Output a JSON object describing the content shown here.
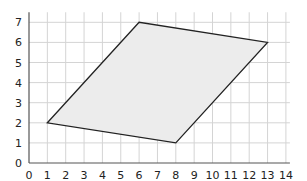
{
  "chart_data": {
    "type": "polygon",
    "title": "",
    "xlabel": "",
    "ylabel": "",
    "xlim": [
      0,
      14
    ],
    "ylim": [
      0,
      7.5
    ],
    "grid": true,
    "x_ticks": [
      0,
      1,
      2,
      3,
      4,
      5,
      6,
      7,
      8,
      9,
      10,
      11,
      12,
      13,
      14
    ],
    "y_ticks": [
      0,
      1,
      2,
      3,
      4,
      5,
      6,
      7
    ],
    "polygon": {
      "name": "parallelogram",
      "vertices": [
        [
          1,
          2
        ],
        [
          6,
          7
        ],
        [
          13,
          6
        ],
        [
          8,
          1
        ]
      ],
      "fill": "#ececec",
      "stroke": "#222222"
    }
  },
  "layout": {
    "origin_px": [
      29,
      163
    ],
    "unit_x_px": 18.35,
    "unit_y_px": 20.1,
    "grid_color": "#d4d4d4",
    "axis_color": "#555555"
  }
}
